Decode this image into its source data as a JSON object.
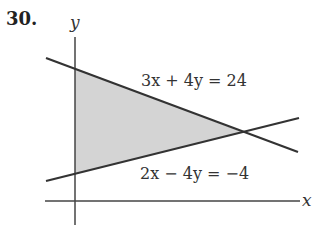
{
  "problem_number": "30.",
  "axes": {
    "x_label": "x",
    "y_label": "y"
  },
  "lines": [
    {
      "equation": "3x + 4y = 24"
    },
    {
      "equation": "2x − 4y = −4"
    }
  ],
  "region": {
    "description": "shaded triangle bounded by y-axis and both lines",
    "fill": "#d4d4d4"
  },
  "colors": {
    "line": "#333333",
    "shade": "#d4d4d4",
    "background": "#ffffff"
  }
}
